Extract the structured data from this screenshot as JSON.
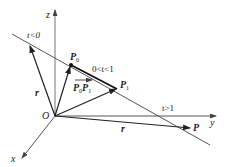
{
  "diagram": {
    "axes": {
      "z": {
        "label": "z"
      },
      "y": {
        "label": "y"
      },
      "x": {
        "label": "x"
      },
      "origin": {
        "label": "O"
      }
    },
    "points": {
      "p0": {
        "label": "P",
        "sub": "0"
      },
      "p1": {
        "label": "P",
        "sub": "1"
      },
      "p": {
        "label": "P"
      }
    },
    "regions": {
      "t_neg": "t<0",
      "t_mid": "0<t<1",
      "t_gt1": "t>1"
    },
    "vectors": {
      "r_left": "r",
      "r_bottom": "r",
      "p0p1": {
        "label_a": "P",
        "sub_a": "0",
        "label_b": "P",
        "sub_b": "1"
      }
    },
    "colors": {
      "line": "#333333",
      "axis": "#555555",
      "background": "#ffffff"
    }
  }
}
